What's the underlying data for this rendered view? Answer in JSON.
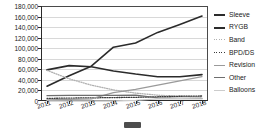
{
  "chart_data": {
    "type": "line",
    "title": "",
    "xlabel": "",
    "ylabel": "",
    "grid": true,
    "legend_position": "right",
    "ylim": [
      0,
      180000
    ],
    "ytick_step": 20000,
    "categories": [
      "2011",
      "2012",
      "2013",
      "2014",
      "2015",
      "2016",
      "2017",
      "2018"
    ],
    "ytick_labels": [
      "180,000",
      "160,000",
      "140,000",
      "120,000",
      "100,000",
      "80,000",
      "60,000",
      "40,000",
      "20,000",
      "0"
    ],
    "series": [
      {
        "name": "Sleeve",
        "color": "#2b2b2b",
        "style": "solid",
        "width": 1.6,
        "values": [
          28000,
          48000,
          66000,
          102000,
          110000,
          130000,
          145000,
          161000
        ]
      },
      {
        "name": "RYGB",
        "color": "#2b2b2b",
        "style": "solid",
        "width": 1.6,
        "values": [
          59000,
          67000,
          65000,
          57000,
          51000,
          46000,
          46000,
          50000
        ]
      },
      {
        "name": "Band",
        "color": "#b0b0b0",
        "style": "dotted",
        "width": 1.3,
        "values": [
          58000,
          42000,
          30000,
          21000,
          15000,
          11000,
          9000,
          8000
        ]
      },
      {
        "name": "BPD/DS",
        "color": "#3a3a3a",
        "style": "dotted",
        "width": 1.3,
        "values": [
          5000,
          5500,
          6000,
          6500,
          7000,
          8000,
          9000,
          9500
        ]
      },
      {
        "name": "Revision",
        "color": "#9a9a9a",
        "style": "solid",
        "width": 1.3,
        "values": [
          2000,
          3000,
          4000,
          16000,
          22000,
          30000,
          38000,
          46000
        ]
      },
      {
        "name": "Other",
        "color": "#6e6e6e",
        "style": "solid",
        "width": 1.3,
        "values": [
          10000,
          10500,
          10500,
          10500,
          11000,
          6000,
          5000,
          5000
        ]
      },
      {
        "name": "Balloons",
        "color": "#cccccc",
        "style": "solid",
        "width": 1.3,
        "values": [
          0,
          0,
          0,
          0,
          1000,
          4000,
          4500,
          4000
        ]
      }
    ]
  },
  "legend": {
    "items": [
      {
        "label": "Sleeve"
      },
      {
        "label": "RYGB"
      },
      {
        "label": "Band"
      },
      {
        "label": "BPD/DS"
      },
      {
        "label": "Revision"
      },
      {
        "label": "Other"
      },
      {
        "label": "Balloons"
      }
    ]
  },
  "artifact": {
    "name": "scroll-thumb"
  }
}
